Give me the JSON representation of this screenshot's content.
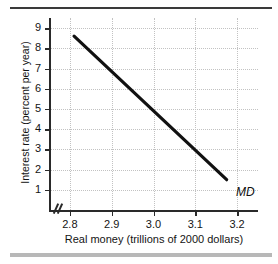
{
  "chart_data": {
    "type": "line",
    "title": "",
    "xlabel": "Real money (trillions of 2000 dollars)",
    "ylabel": "Interest rate (percent per year)",
    "xlim": [
      2.75,
      3.25
    ],
    "ylim": [
      0,
      9.5
    ],
    "xticks": [
      "2.8",
      "2.9",
      "3.0",
      "3.1",
      "3.2"
    ],
    "xtick_values": [
      2.8,
      2.9,
      3.0,
      3.1,
      3.2
    ],
    "yticks": [
      "9",
      "8",
      "7",
      "6",
      "5",
      "4",
      "3",
      "2",
      "1"
    ],
    "ytick_values": [
      9,
      8,
      7,
      6,
      5,
      4,
      3,
      2,
      1
    ],
    "grid": true,
    "legend_position": "inline-end-of-line",
    "axis_break_x": true,
    "series": [
      {
        "name": "MD",
        "label": "MD",
        "color": "#111111",
        "x": [
          2.81,
          3.175
        ],
        "values": [
          8.6,
          1.5
        ]
      }
    ],
    "annotations": [
      {
        "text": "MD",
        "x": 3.19,
        "y": 1.2
      }
    ]
  },
  "figure": {
    "top_rule": "",
    "bottom_rule": ""
  }
}
